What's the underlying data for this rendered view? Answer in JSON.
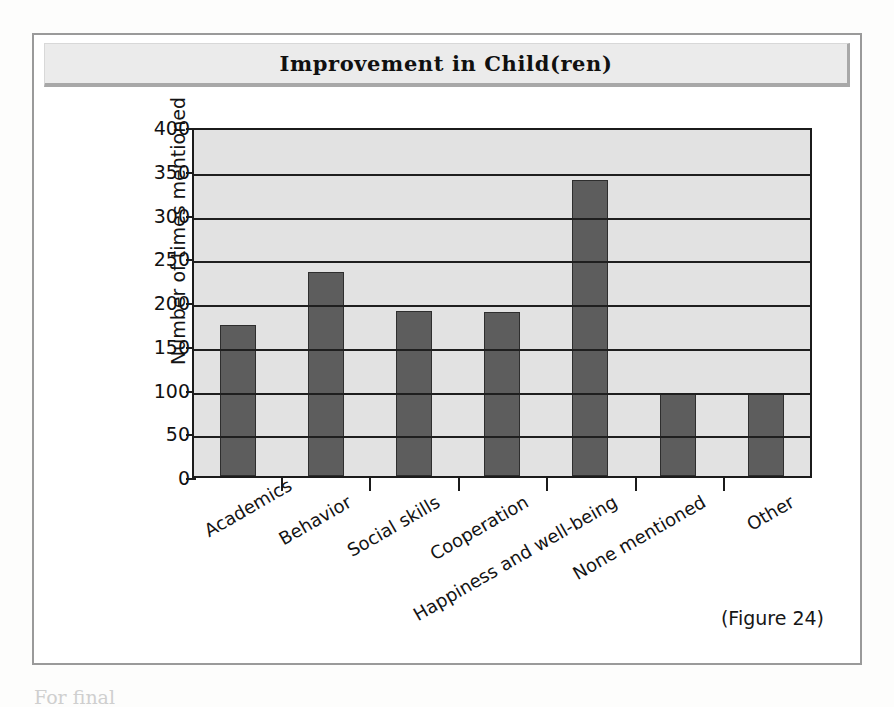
{
  "figure": {
    "title": "Improvement in Child(ren)",
    "caption": "(Figure 24)"
  },
  "page": {
    "body_text_fragment": "For final"
  },
  "colors": {
    "bar_fill": "#5d5d5d",
    "bar_border": "#2e2e2e",
    "plot_background": "#e2e2e2",
    "gridline": "#1f1f1f",
    "frame_border": "#9a9a9a",
    "banner_background": "#ebebeb"
  },
  "chart_data": {
    "type": "bar",
    "title": "Improvement in Child(ren)",
    "xlabel": "",
    "ylabel": "Number of times mentioned",
    "ylim": [
      0,
      400
    ],
    "yticks": [
      0,
      50,
      100,
      150,
      200,
      250,
      300,
      350,
      400
    ],
    "grid": true,
    "legend": false,
    "categories": [
      "Academics",
      "Behavior",
      "Social skills",
      "Cooperation",
      "Happiness and well-being",
      "None mentioned",
      "Other"
    ],
    "values": [
      175,
      236,
      191,
      190,
      342,
      96,
      96
    ]
  }
}
